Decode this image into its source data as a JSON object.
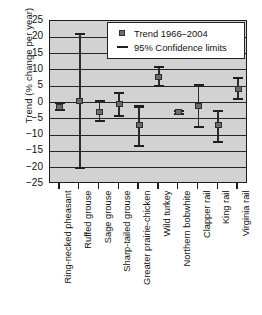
{
  "chart_data": {
    "type": "scatter",
    "title": "",
    "xlabel": "",
    "ylabel": "Trend (% change per year)",
    "ylim": [
      -25,
      25
    ],
    "yticks": [
      25,
      20,
      15,
      10,
      5,
      0,
      -5,
      -10,
      -15,
      -20,
      -25
    ],
    "ytick_labels": [
      "25",
      "20",
      "15",
      "10",
      "5",
      "0",
      "-5",
      "-10",
      "-15",
      "-20",
      "-25"
    ],
    "grid": true,
    "legend_position": "top-right",
    "legend": [
      {
        "marker": "square",
        "label": "Trend 1966–2004"
      },
      {
        "marker": "line",
        "label": "95% Confidence limits"
      }
    ],
    "categories": [
      "Ring-necked pheasant",
      "Ruffed grouse",
      "Sage grouse",
      "Sharp-tailed grouse",
      "Greater prairie-chicken",
      "Wild turkey",
      "Northern bobwhite",
      "Clapper rail",
      "King rail",
      "Virginia rail"
    ],
    "series": [
      {
        "name": "Trend 1966–2004",
        "values": [
          -1.5,
          0.4,
          -2.8,
          -0.5,
          -7.0,
          7.8,
          -3.0,
          -1.1,
          -7.0,
          4.2
        ]
      }
    ],
    "error_bars": {
      "name": "95% Confidence limits",
      "upper": [
        0.0,
        21.0,
        0.5,
        3.0,
        -1.2,
        11.0,
        -2.6,
        5.4,
        -2.6,
        7.4
      ],
      "lower": [
        -2.4,
        -20.0,
        -5.7,
        -4.0,
        -13.3,
        5.0,
        -3.4,
        -7.6,
        -12.2,
        1.0
      ]
    },
    "points": [
      {
        "category": "Ring-necked pheasant",
        "trend": -1.5,
        "ci_upper": 0.0,
        "ci_lower": -2.4
      },
      {
        "category": "Ruffed grouse",
        "trend": 0.4,
        "ci_upper": 21.0,
        "ci_lower": -20.0
      },
      {
        "category": "Sage grouse",
        "trend": -2.8,
        "ci_upper": 0.5,
        "ci_lower": -5.7
      },
      {
        "category": "Sharp-tailed grouse",
        "trend": -0.5,
        "ci_upper": 3.0,
        "ci_lower": -4.0
      },
      {
        "category": "Greater prairie-chicken",
        "trend": -7.0,
        "ci_upper": -1.2,
        "ci_lower": -13.3
      },
      {
        "category": "Wild turkey",
        "trend": 7.8,
        "ci_upper": 11.0,
        "ci_lower": 5.0
      },
      {
        "category": "Northern bobwhite",
        "trend": -3.0,
        "ci_upper": -2.6,
        "ci_lower": -3.4
      },
      {
        "category": "Clapper rail",
        "trend": -1.1,
        "ci_upper": 5.4,
        "ci_lower": -7.6
      },
      {
        "category": "King rail",
        "trend": -7.0,
        "ci_upper": -2.6,
        "ci_lower": -12.2
      },
      {
        "category": "Virginia rail",
        "trend": 4.2,
        "ci_upper": 7.4,
        "ci_lower": 1.0
      }
    ],
    "colors": {
      "plot_background": "#d2d2d2",
      "axis": "#1c1c1c",
      "gridline": "#262626",
      "marker_fill": "#6b6b6b",
      "marker_edge": "#2d2d2d",
      "errorbar": "#1f1f1f",
      "legend_background": "#ffffff"
    }
  }
}
